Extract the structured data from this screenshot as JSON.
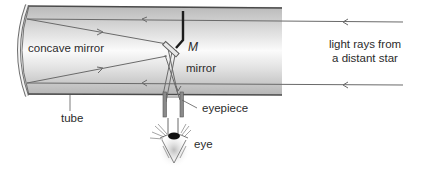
{
  "diagram": {
    "labels": {
      "concave_mirror": "concave mirror",
      "mirror_letter": "M",
      "mirror": "mirror",
      "light_rays_line1": "light rays from",
      "light_rays_line2": "a distant star",
      "eyepiece": "eyepiece",
      "tube": "tube",
      "eye": "eye"
    },
    "colors": {
      "tube_fill_light": "#f4f4f4",
      "tube_fill_dark": "#c9c9c9",
      "tube_edge": "#5a5a5a",
      "ray": "#6a6a6a",
      "text": "#2b2b2b"
    }
  }
}
